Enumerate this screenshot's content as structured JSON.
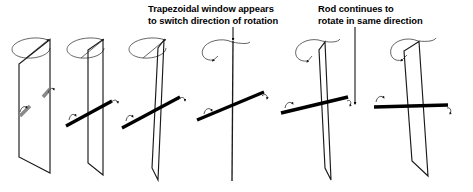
{
  "figure": {
    "background_color": "#ffffff",
    "line_color": "#1a1a1a",
    "rod_color": "#000000",
    "rod_faded_color": "#8a8a8a",
    "arrow_color": "#3a3a3a",
    "width": 473,
    "height": 192
  },
  "annotations": [
    {
      "id": "annot-window",
      "name": "trapezoid-window-annotation",
      "line1": "Trapezoidal window appears",
      "line2": "to switch direction of rotation",
      "leader": "short vertical arrow pointing down to panel 4 window top"
    },
    {
      "id": "annot-rod",
      "name": "rod-annotation",
      "line1": "Rod continues to",
      "line2": "rotate in same direction",
      "leader": "long vertical arrow pointing down to panel 5 rod"
    }
  ],
  "panels": [
    {
      "index": 1,
      "name": "panel-1",
      "window_state": "oblique, near full width trapezoid",
      "rod_state": "foreshortened stub, faded gray, pointing toward viewer",
      "spin_arrow": "ellipse arc, arrowhead at right pointing right"
    },
    {
      "index": 2,
      "name": "panel-2",
      "window_state": "narrow oblique trapezoid",
      "rod_state": "rod tilted, left end low, right end high, short",
      "spin_arrow": "ellipse arc, arrowhead at right pointing right"
    },
    {
      "index": 3,
      "name": "panel-3",
      "window_state": "thin sliver, nearly edge on",
      "rod_state": "rod tilted, spanning full width, left end low",
      "spin_arrow": "ellipse arc, arrowhead at top right pointing right"
    },
    {
      "index": 4,
      "name": "panel-4",
      "window_state": "perfectly edge on, single vertical line",
      "rod_state": "rod tilted, maximum length, left end low",
      "spin_arrow": "arc curving left, arrowhead pointing down-left"
    },
    {
      "index": 5,
      "name": "panel-5",
      "window_state": "thin sliver, nearly edge on, opposite slant",
      "rod_state": "rod nearly horizontal, full width",
      "spin_arrow": "arc curving left, arrowhead pointing down-left"
    },
    {
      "index": 6,
      "name": "panel-6",
      "window_state": "narrow oblique trapezoid, opposite slant",
      "rod_state": "rod horizontal, full width",
      "spin_arrow": "arc curving left, arrowhead pointing down-left"
    }
  ]
}
